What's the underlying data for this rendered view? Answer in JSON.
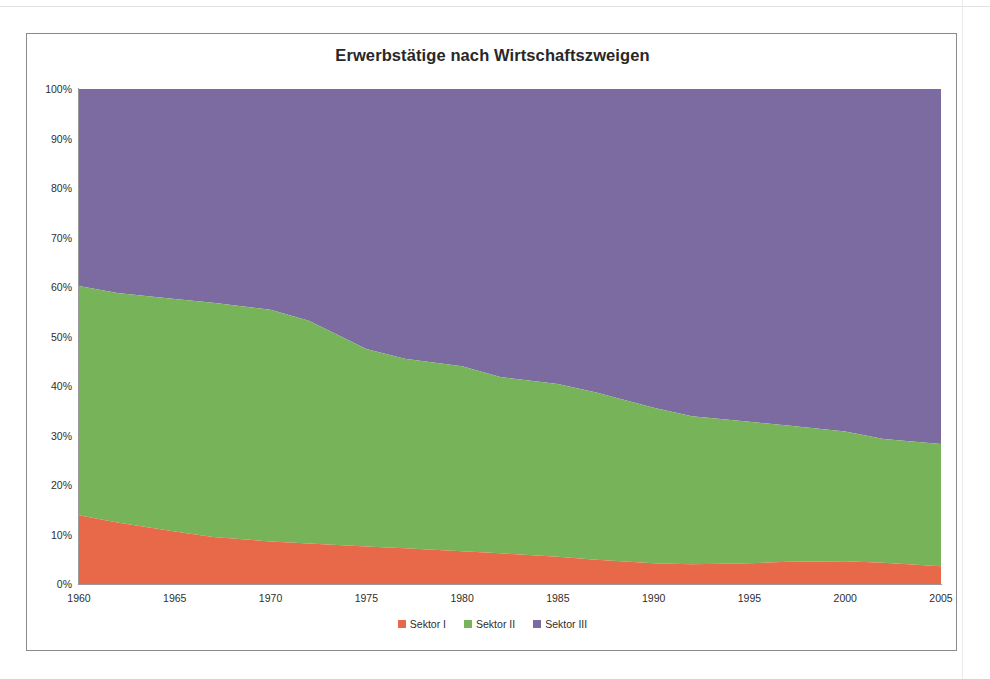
{
  "chart_data": {
    "type": "area",
    "stacked": true,
    "percent_stacked": true,
    "title": "Erwerbstätige nach Wirtschaftszweigen",
    "xlabel": "",
    "ylabel": "",
    "x": [
      1960,
      1962,
      1965,
      1967,
      1970,
      1972,
      1975,
      1977,
      1980,
      1982,
      1985,
      1987,
      1990,
      1992,
      1995,
      1997,
      2000,
      2002,
      2005
    ],
    "xlim": [
      1960,
      2005
    ],
    "ylim": [
      0,
      100
    ],
    "xticks": [
      "1960",
      "1965",
      "1970",
      "1975",
      "1980",
      "1985",
      "1990",
      "1995",
      "2000",
      "2005"
    ],
    "yticks": [
      "0%",
      "10%",
      "20%",
      "30%",
      "40%",
      "50%",
      "60%",
      "70%",
      "80%",
      "90%",
      "100%"
    ],
    "grid": false,
    "legend_position": "bottom",
    "series": [
      {
        "name": "Sektor I",
        "color": "#e8694a",
        "values": [
          13.9,
          12.4,
          10.6,
          9.5,
          8.6,
          8.2,
          7.6,
          7.2,
          6.6,
          6.2,
          5.5,
          4.9,
          4.2,
          4.0,
          4.2,
          4.5,
          4.6,
          4.3,
          3.6
        ]
      },
      {
        "name": "Sektor II",
        "color": "#77b359",
        "values": [
          46.3,
          46.4,
          47.0,
          47.3,
          46.8,
          45.0,
          39.9,
          38.3,
          37.4,
          35.6,
          34.9,
          33.8,
          31.4,
          29.9,
          28.6,
          27.5,
          26.2,
          25.0,
          24.7
        ]
      },
      {
        "name": "Sektor III",
        "color": "#7c6ba0",
        "values": [
          39.8,
          41.2,
          42.4,
          43.2,
          44.6,
          46.8,
          52.5,
          54.5,
          56.0,
          58.2,
          59.6,
          61.3,
          64.4,
          66.1,
          67.2,
          68.0,
          69.2,
          70.7,
          71.7
        ]
      }
    ],
    "cumulative_top_sektor1": [
      13.9,
      12.4,
      10.6,
      9.5,
      8.6,
      8.2,
      7.6,
      7.2,
      6.6,
      6.2,
      5.5,
      4.9,
      4.2,
      4.0,
      4.2,
      4.5,
      4.6,
      4.3,
      3.6
    ],
    "cumulative_top_sektor2": [
      60.2,
      58.8,
      57.6,
      56.8,
      55.4,
      53.2,
      47.5,
      45.5,
      44.0,
      41.8,
      40.4,
      38.7,
      35.6,
      33.9,
      32.8,
      32.0,
      30.8,
      29.3,
      28.3
    ]
  },
  "legend": {
    "items": [
      {
        "label": "Sektor I",
        "color": "#e8694a"
      },
      {
        "label": "Sektor II",
        "color": "#77b359"
      },
      {
        "label": "Sektor III",
        "color": "#7c6ba0"
      }
    ]
  }
}
